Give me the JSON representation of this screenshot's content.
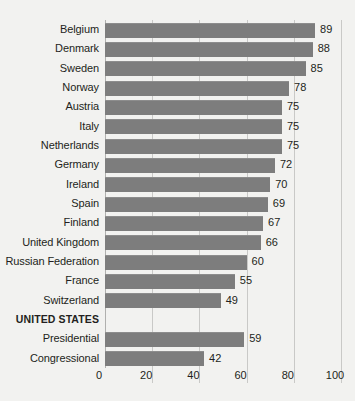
{
  "chart_data": {
    "type": "bar",
    "orientation": "horizontal",
    "title": "",
    "subtitle": "",
    "xlabel": "",
    "ylabel": "",
    "xlim": [
      0,
      100
    ],
    "xticks": [
      0,
      20,
      40,
      60,
      80,
      100
    ],
    "xtick_labels": [
      "0",
      "20",
      "40",
      "60",
      "80",
      "100"
    ],
    "grid": true,
    "legend": null,
    "bar_color": "#7d7d7d",
    "background_color": "#f2f2f0",
    "text_color": "#231f20",
    "gridline_color": "#c9c9c7",
    "categories": [
      "Belgium",
      "Denmark",
      "Sweden",
      "Norway",
      "Austria",
      "Italy",
      "Netherlands",
      "Germany",
      "Ireland",
      "Spain",
      "Finland",
      "United Kingdom",
      "Russian Federation",
      "France",
      "Switzerland",
      "UNITED STATES",
      "Presidential",
      "Congressional"
    ],
    "values": [
      89,
      88,
      85,
      78,
      75,
      75,
      75,
      72,
      70,
      69,
      67,
      66,
      60,
      55,
      49,
      null,
      59,
      42
    ],
    "rows": [
      {
        "label": "Belgium",
        "value": 89,
        "value_label": "89",
        "heading": false
      },
      {
        "label": "Denmark",
        "value": 88,
        "value_label": "88",
        "heading": false
      },
      {
        "label": "Sweden",
        "value": 85,
        "value_label": "85",
        "heading": false
      },
      {
        "label": "Norway",
        "value": 78,
        "value_label": "78",
        "heading": false
      },
      {
        "label": "Austria",
        "value": 75,
        "value_label": "75",
        "heading": false
      },
      {
        "label": "Italy",
        "value": 75,
        "value_label": "75",
        "heading": false
      },
      {
        "label": "Netherlands",
        "value": 75,
        "value_label": "75",
        "heading": false
      },
      {
        "label": "Germany",
        "value": 72,
        "value_label": "72",
        "heading": false
      },
      {
        "label": "Ireland",
        "value": 70,
        "value_label": "70",
        "heading": false
      },
      {
        "label": "Spain",
        "value": 69,
        "value_label": "69",
        "heading": false
      },
      {
        "label": "Finland",
        "value": 67,
        "value_label": "67",
        "heading": false
      },
      {
        "label": "United Kingdom",
        "value": 66,
        "value_label": "66",
        "heading": false
      },
      {
        "label": "Russian Federation",
        "value": 60,
        "value_label": "60",
        "heading": false
      },
      {
        "label": "France",
        "value": 55,
        "value_label": "55",
        "heading": false
      },
      {
        "label": "Switzerland",
        "value": 49,
        "value_label": "49",
        "heading": false
      },
      {
        "label": "UNITED STATES",
        "value": null,
        "value_label": "",
        "heading": true
      },
      {
        "label": "Presidential",
        "value": 59,
        "value_label": "59",
        "heading": false
      },
      {
        "label": "Congressional",
        "value": 42,
        "value_label": "42",
        "heading": false
      }
    ]
  }
}
